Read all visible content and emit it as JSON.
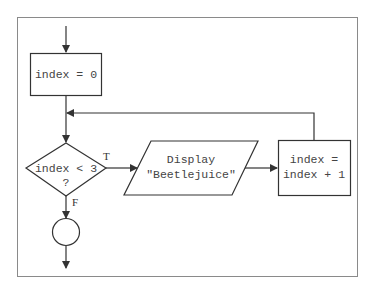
{
  "diagram": {
    "type": "flowchart",
    "colors": {
      "line": "#333333",
      "frame": "#8a8a8a",
      "text": "#444444",
      "background": "#ffffff"
    },
    "nodes": {
      "init": {
        "shape": "process",
        "text": "index = 0"
      },
      "condition": {
        "shape": "decision",
        "line1": "index < 3",
        "line2": "?"
      },
      "display": {
        "shape": "input-output",
        "line1": "Display",
        "line2": "\"Beetlejuice\""
      },
      "increment": {
        "shape": "process",
        "line1": "index =",
        "line2": "index + 1"
      },
      "connector": {
        "shape": "connector"
      }
    },
    "edge_labels": {
      "true": "T",
      "false": "F"
    },
    "edges": [
      {
        "from": "start",
        "to": "init"
      },
      {
        "from": "init",
        "to": "condition"
      },
      {
        "from": "condition",
        "to": "display",
        "label": "T"
      },
      {
        "from": "display",
        "to": "increment"
      },
      {
        "from": "increment",
        "to": "condition",
        "type": "loop"
      },
      {
        "from": "condition",
        "to": "connector",
        "label": "F"
      },
      {
        "from": "connector",
        "to": "end"
      }
    ]
  }
}
